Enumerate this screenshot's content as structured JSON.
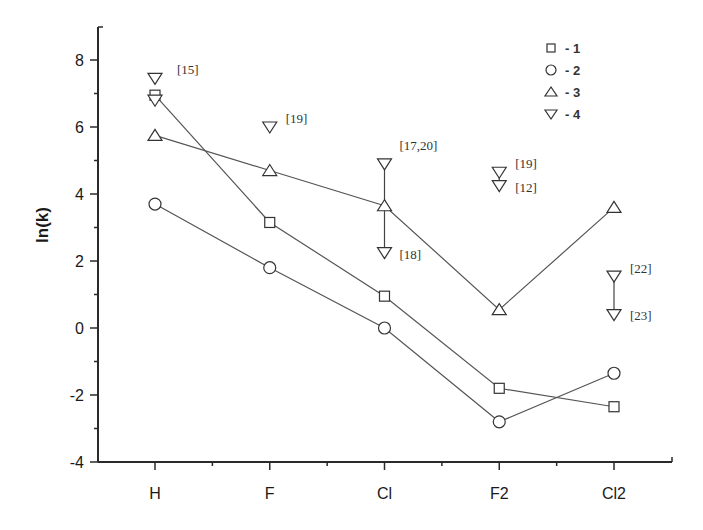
{
  "chart_data": {
    "type": "line",
    "title": "",
    "xlabel": "",
    "ylabel": "ln(k)",
    "categories": [
      "H",
      "F",
      "Cl",
      "F2",
      "Cl2"
    ],
    "ylim": [
      -4,
      9
    ],
    "yticks": [
      -4,
      -2,
      0,
      2,
      4,
      6,
      8
    ],
    "grid": false,
    "legend_position": "top-right",
    "series": [
      {
        "name": "1",
        "marker": "square",
        "connected": true,
        "values": [
          6.95,
          3.15,
          0.95,
          -1.8,
          -2.35
        ]
      },
      {
        "name": "2",
        "marker": "circle",
        "connected": true,
        "values": [
          3.7,
          1.8,
          0.0,
          -2.8,
          -1.35
        ]
      },
      {
        "name": "3",
        "marker": "triangle-up",
        "connected": true,
        "values": [
          5.75,
          4.7,
          3.65,
          0.55,
          3.6
        ]
      },
      {
        "name": "4",
        "marker": "triangle-down",
        "connected": false,
        "points": [
          {
            "x": "H",
            "y": 7.45,
            "label": "[15]"
          },
          {
            "x": "H",
            "y": 6.8,
            "label": ""
          },
          {
            "x": "F",
            "y": 6.0,
            "label": "[19]"
          },
          {
            "x": "Cl",
            "y": 4.9,
            "label": "[17,20]"
          },
          {
            "x": "Cl",
            "y": 2.25,
            "label": "[18]"
          },
          {
            "x": "F2",
            "y": 4.65,
            "label": "[19]"
          },
          {
            "x": "F2",
            "y": 4.25,
            "label": "[12]"
          },
          {
            "x": "Cl2",
            "y": 1.55,
            "label": "[22]"
          },
          {
            "x": "Cl2",
            "y": 0.4,
            "label": "[23]"
          }
        ],
        "range_lines": [
          {
            "x": "Cl",
            "from": 4.9,
            "to": 2.25
          },
          {
            "x": "F2",
            "from": 4.65,
            "to": 4.25
          },
          {
            "x": "Cl2",
            "from": 1.55,
            "to": 0.4
          }
        ]
      }
    ],
    "legend": [
      {
        "marker": "square",
        "label": "- 1"
      },
      {
        "marker": "circle",
        "label": "- 2"
      },
      {
        "marker": "triangle-up",
        "label": "- 3"
      },
      {
        "marker": "triangle-down",
        "label": "- 4"
      }
    ]
  }
}
